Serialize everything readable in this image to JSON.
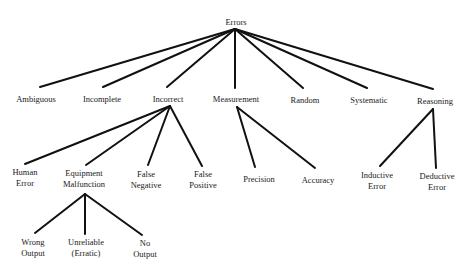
{
  "diagram": {
    "type": "tree",
    "root": {
      "label": "Errors"
    },
    "level1": [
      {
        "label": "Ambiguous"
      },
      {
        "label": "Incomplete"
      },
      {
        "label": "Incorrect"
      },
      {
        "label": "Measurement"
      },
      {
        "label": "Random"
      },
      {
        "label": "Systematic"
      },
      {
        "label": "Reasoning"
      }
    ],
    "incorrect_children": [
      {
        "line1": "Human",
        "line2": "Error"
      },
      {
        "line1": "Equipment",
        "line2": "Malfunction"
      },
      {
        "line1": "False",
        "line2": "Negative"
      },
      {
        "line1": "False",
        "line2": "Positive"
      }
    ],
    "measurement_children": [
      {
        "label": "Precision"
      },
      {
        "label": "Accuracy"
      }
    ],
    "reasoning_children": [
      {
        "line1": "Inductive",
        "line2": "Error"
      },
      {
        "line1": "Deductive",
        "line2": "Error"
      }
    ],
    "equipment_children": [
      {
        "line1": "Wrong",
        "line2": "Output"
      },
      {
        "line1": "Unreliable",
        "line2": "(Erratic)"
      },
      {
        "line1": "No",
        "line2": "Output"
      }
    ],
    "line_color": "#111111",
    "text_color": "#1a1a1a"
  }
}
